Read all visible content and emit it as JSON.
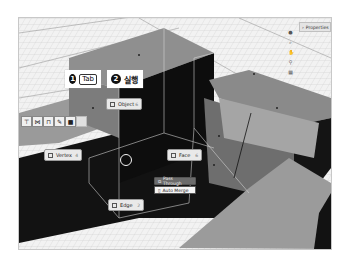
{
  "viewport": {
    "properties_tab": "Properties",
    "nav_icons": [
      "view-sphere-icon",
      "zoom-icon",
      "hand-pan-icon",
      "camera-icon",
      "grid-icon"
    ]
  },
  "callouts": [
    {
      "number": "1",
      "key": "Tab"
    },
    {
      "number": "2",
      "text": "실행"
    }
  ],
  "pie_menu": {
    "object": {
      "label": "Object",
      "hotkey": "6"
    },
    "vertex": {
      "label": "Vertex",
      "hotkey": "4"
    },
    "face": {
      "label": "Face",
      "hotkey": "6"
    },
    "edge": {
      "label": "Edge",
      "hotkey": "2"
    },
    "pass_through": {
      "label": "Pass Through"
    },
    "auto_merge": {
      "label": "Auto Merge"
    }
  },
  "toolbar": {
    "items": [
      "vertex-select-icon",
      "edge-select-icon",
      "face-select-icon",
      "brush-icon",
      "x-ray-icon"
    ]
  },
  "colors": {
    "background": "#ffffff",
    "dark_face": "#111111",
    "grey_face": "#8a8a8a",
    "grid_floor": "#eeeeee"
  }
}
